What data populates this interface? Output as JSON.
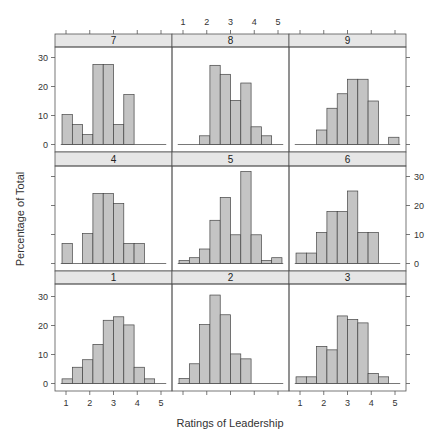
{
  "chart_data": {
    "type": "bar",
    "subtype": "lattice-histogram",
    "title": "",
    "xlabel": "Ratings of Leadership",
    "ylabel": "Percentage of Total",
    "xlim": [
      0.75,
      5.6
    ],
    "ylim": [
      0,
      35
    ],
    "x_ticks": [
      1,
      2,
      3,
      4,
      5
    ],
    "y_ticks": [
      0,
      10,
      20,
      30
    ],
    "bin_edges": [
      0.833,
      1.267,
      1.7,
      2.133,
      2.567,
      3.0,
      3.433,
      3.867,
      4.3,
      4.733,
      5.167
    ],
    "grid": false,
    "layout": {
      "columns": 3,
      "rows": 3
    },
    "colors": {
      "bar_fill": "#c4c4c4",
      "bar_stroke": "#444444",
      "strip_fill": "#e6e6e6",
      "frame": "#555555"
    },
    "panels": [
      {
        "label": "7",
        "row": 0,
        "col": 0,
        "values": [
          10.3,
          6.9,
          3.4,
          27.6,
          27.6,
          6.9,
          17.2,
          0,
          0,
          0
        ]
      },
      {
        "label": "8",
        "row": 0,
        "col": 1,
        "values": [
          0,
          0,
          3.0,
          27.3,
          24.2,
          15.2,
          21.2,
          6.1,
          3.0,
          0
        ]
      },
      {
        "label": "9",
        "row": 0,
        "col": 2,
        "values": [
          0,
          0,
          5.0,
          12.5,
          17.5,
          22.5,
          22.5,
          15.0,
          0,
          2.5
        ]
      },
      {
        "label": "4",
        "row": 1,
        "col": 0,
        "values": [
          6.9,
          0,
          10.3,
          24.1,
          24.1,
          20.7,
          6.9,
          6.9,
          0,
          0
        ]
      },
      {
        "label": "5",
        "row": 1,
        "col": 1,
        "values": [
          1.0,
          2.0,
          5.0,
          14.9,
          22.8,
          9.9,
          31.7,
          9.9,
          1.0,
          2.0
        ]
      },
      {
        "label": "6",
        "row": 1,
        "col": 2,
        "values": [
          3.6,
          3.6,
          10.7,
          17.9,
          17.9,
          25.0,
          10.7,
          10.7,
          0,
          0
        ]
      },
      {
        "label": "1",
        "row": 2,
        "col": 0,
        "values": [
          1.6,
          5.6,
          8.2,
          13.5,
          21.8,
          23.0,
          20.2,
          5.6,
          1.6,
          0
        ]
      },
      {
        "label": "2",
        "row": 2,
        "col": 1,
        "values": [
          1.7,
          6.8,
          20.3,
          30.5,
          23.7,
          10.2,
          8.5,
          0,
          0,
          0
        ]
      },
      {
        "label": "3",
        "row": 2,
        "col": 2,
        "values": [
          2.3,
          2.3,
          12.8,
          11.6,
          23.3,
          22.1,
          20.9,
          3.5,
          2.3,
          0
        ]
      }
    ],
    "axis_labels_placement": {
      "top_x_labels_col": 1,
      "bottom_x_labels_cols": [
        0,
        2
      ],
      "left_y_labels_rows": [
        0,
        2
      ],
      "right_y_labels_rows": [
        1
      ]
    }
  }
}
